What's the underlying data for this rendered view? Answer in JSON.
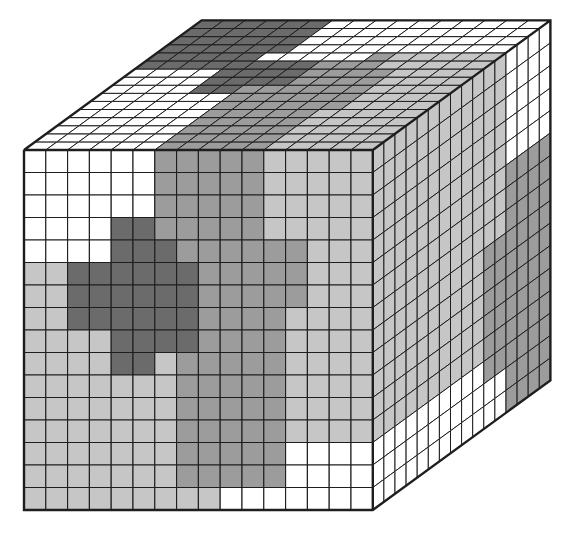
{
  "figure": {
    "grid_size": 16,
    "palette": {
      "W": "#ffffff",
      "L": "#c6c6c6",
      "M": "#9c9c9c",
      "D": "#6b6b6b",
      "line": "#1e1e1e"
    },
    "geometry": {
      "front_origin": [
        24,
        150
      ],
      "cell_width": 21.8,
      "cell_height": 22.5,
      "depth_step": [
        11.1,
        -8.1
      ]
    },
    "faces": {
      "front": {
        "label": "front-face",
        "rows": [
          "WWWWWWMMMMMLLLLL",
          "WWWWWWMMMMMLLLLL",
          "WWWWWWMMMMMLLLLL",
          "WWWWDDMMMMMLLLLL",
          "WWWWDDDMMMMMMLLL",
          "LLDDDDDDMMMMMLLL",
          "LLDDDDDDMMMMMLLL",
          "LLDDDDDDMMMMLLLL",
          "LLLLDDDDMMMMLLLL",
          "LLLLDDLMMMMMLLLL",
          "LLLLLLLMMMMMLLLL",
          "LLLLLLLMMMMMLLLL",
          "LLLLLLLMMMMMLLLL",
          "LLLLLLLMMMMMWWWW",
          "LLLLLLLMMMMMWWWW",
          "LLLLLLLLLWWWWWWW"
        ]
      },
      "top": {
        "label": "top-face",
        "note": "rows listed from front edge (depth 0) to back edge (depth 15)",
        "rows": [
          "WWWWWWMMMMMLLLLL",
          "WWWWWWMMMMMLLLLL",
          "WWWWWWMMMMMLLLLL",
          "WWWWWWMMMMMLLLLL",
          "WWWWWWMMMMMLLLLL",
          "WWWWWWMMMMMMLLLL",
          "WWWWWWMMMMMMLLLL",
          "WWWWDDMMMMMMLLLL",
          "WWWWDDDDMMMMLLLL",
          "WWWWDDDDMMMMLLLL",
          "DDDDDDDDMMMLLLLL",
          "DDDDDWWWWWMLLLLL",
          "DDDDDDWWWWWWWWWW",
          "DDDDDDWWWWWWWWWW",
          "DDDDDDWWWWWWWWWW",
          "DDDDDDWWWWWWWWWW"
        ]
      },
      "right": {
        "label": "right-face",
        "note": "rows listed top to bottom; columns from front edge (depth 0) to back edge (depth 15)",
        "rows": [
          "LLLLLLLLLLLLWWWW",
          "LLLLLLLLLLLLWWWW",
          "LLLLLLLLLLLLWWWW",
          "LLLLLLLLLLLLWWWW",
          "LLLLLLLLLLLLWWWW",
          "LLLLLLLLLLLLMMMM",
          "LLLLLLLLLLLLMMMM",
          "LLLLLLLLLLLLMMMM",
          "LLLLLLLLLLMMMMMM",
          "LLLLLLLLLLMMMMMM",
          "LLLLLLLLLLMMMMMM",
          "LLLLLLLLLLMMMMMM",
          "LLLLLLLLLLMMMMMM",
          "WWWWWWWWWWMMMMMM",
          "WWWWWWWWWWWWMMMM",
          "WWWWWWWWWWWWMMMM"
        ]
      }
    }
  }
}
